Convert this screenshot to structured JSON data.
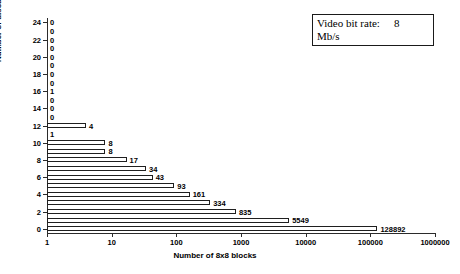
{
  "legend": {
    "label": "Video bit rate:",
    "value": "8",
    "unit": "Mb/s"
  },
  "chart_data": {
    "type": "bar",
    "orientation": "horizontal",
    "title": "",
    "xlabel": "Number of 8x8 blocks",
    "ylabel": "Number of discarded VLCs per block",
    "xscale": "log",
    "xlim": [
      1,
      1000000
    ],
    "xticks": [
      1,
      10,
      100,
      1000,
      10000,
      100000,
      1000000
    ],
    "xticklabels": [
      "1",
      "10",
      "100",
      "1000",
      "10000",
      "100000",
      "1000000"
    ],
    "ylim": [
      -0.5,
      24.5
    ],
    "yticks": [
      0,
      2,
      4,
      6,
      8,
      10,
      12,
      14,
      16,
      18,
      20,
      22,
      24
    ],
    "yticklabels": [
      "0",
      "2",
      "4",
      "6",
      "8",
      "10",
      "12",
      "14",
      "16",
      "18",
      "20",
      "22",
      "24"
    ],
    "grid": false,
    "legend_position": "top-right",
    "categories": [
      0,
      1,
      2,
      3,
      4,
      5,
      6,
      7,
      8,
      9,
      10,
      11,
      12,
      13,
      14,
      15,
      16,
      17,
      18,
      19,
      20,
      21,
      22,
      23,
      24
    ],
    "values": [
      128892,
      5549,
      835,
      334,
      161,
      93,
      43,
      34,
      17,
      8,
      8,
      1,
      4,
      0,
      0,
      0,
      1,
      0,
      0,
      0,
      0,
      0,
      0,
      0,
      0
    ],
    "datalabels": [
      "128892",
      "5549",
      "835",
      "334",
      "161",
      "93",
      "43",
      "34",
      "17",
      "8",
      "8",
      "1",
      "4",
      "0",
      "0",
      "0",
      "1",
      "0",
      "0",
      "0",
      "0",
      "0",
      "0",
      "0",
      "0"
    ],
    "annotations": [
      "Video bit rate: 8 Mb/s"
    ]
  }
}
